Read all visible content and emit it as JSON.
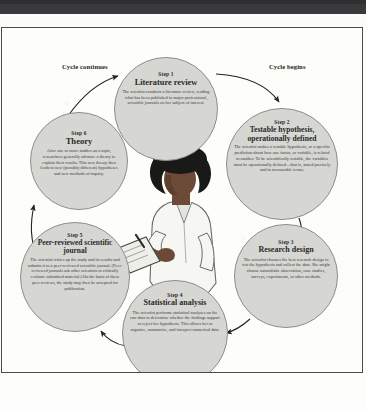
{
  "figure": {
    "labels": {
      "cycle_continues": "Cycle continues",
      "cycle_begins": "Cycle begins"
    },
    "center_illustration": "scientist-writing-on-clipboard",
    "steps": [
      {
        "id": "step1",
        "number": "Step 1",
        "title": "Literature review",
        "body": "The scientist conducts a literature review, reading what has been published in major professional, scientific journals on her subject of interest."
      },
      {
        "id": "step2",
        "number": "Step 2",
        "title": "Testable hypothesis, operationally defined",
        "body": "The scientist makes a testable hypothesis, or a specific prediction about how one factor, or variable, is related to another. To be scientifically testable, the variables must be operationally defined—that is, stated precisely and in measurable terms.",
        "bold_terms": [
          "hypothesis",
          "operationally defined"
        ]
      },
      {
        "id": "step3",
        "number": "Step 3",
        "title": "Research design",
        "body": "The scientist chooses the best research design to test the hypothesis and collect the data. She might choose naturalistic observation, case studies, surveys, experiments, or other methods."
      },
      {
        "id": "step4",
        "number": "Step 4",
        "title": "Statistical analysis",
        "body": "The scientist performs statistical analyses on the raw data to determine whether the findings support or reject her hypothesis. This allows her to organize, summarize, and interpret numerical data."
      },
      {
        "id": "step5",
        "number": "Step 5",
        "title": "Peer-reviewed scientific journal",
        "body": "The scientist writes up the study and its results and submits it to a peer-reviewed scientific journal. (Peer-reviewed journals ask other scientists to critically evaluate submitted material.) On the basis of these peer reviews, the study may then be accepted for publication.",
        "italic_terms": [
          "peer-reviewed scientific journal"
        ]
      },
      {
        "id": "step6",
        "number": "Step 6",
        "title": "Theory",
        "body": "After one or more studies on a topic, researchers generally advance a theory to explain their results. This new theory then leads to new (possibly different) hypotheses and new methods of inquiry.",
        "bold_terms": [
          "theory"
        ]
      }
    ],
    "colors": {
      "bubble_fill": "#d6d6d2",
      "bubble_stroke": "#8d8d8a",
      "frame_stroke": "#4a4a4a",
      "scan_band": "#3a3a3c",
      "page_background": "#fdfdfa",
      "text": "#2a2a28"
    }
  }
}
